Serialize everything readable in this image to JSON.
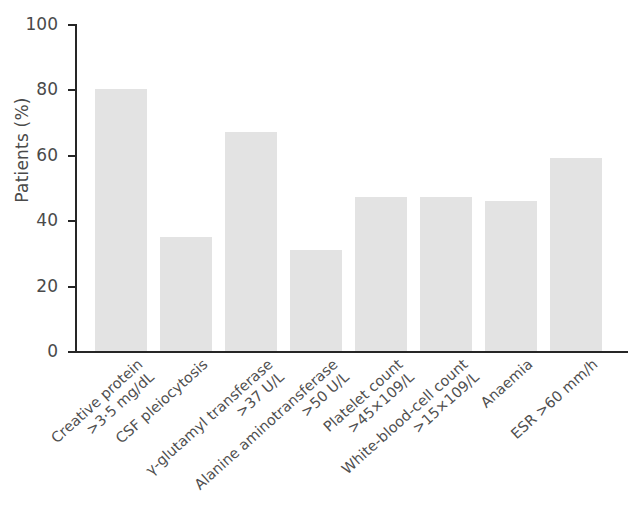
{
  "chart_data": {
    "type": "bar",
    "title": "",
    "subtitle": "",
    "xlabel": "",
    "ylabel": "Patients (%)",
    "ylim": [
      0,
      100
    ],
    "yticks": [
      0,
      20,
      40,
      60,
      80,
      100
    ],
    "ytick_labels": [
      "0",
      "20",
      "40",
      "60",
      "80",
      "100"
    ],
    "grid": false,
    "legend": false,
    "bar_color": "#e3e3e3",
    "axis_color": "#262626",
    "text_color": "#4a4a4a",
    "categories": [
      "Creative protein >3·5 mg/dL",
      "CSF pleiocytosis",
      "γ-glutamyl transferase >37 U/L",
      "Alanine aminotransferase >50 U/L",
      "Platelet count >45×10⁹/L",
      "White-blood-cell count >15×10⁹/L",
      "Anaemia",
      "ESR >60 mm/h"
    ],
    "category_lines": [
      {
        "line1": "Creative protein",
        "line2": ">3·5 mg/dL"
      },
      {
        "line1": "CSF pleiocytosis",
        "line2": ""
      },
      {
        "line1": "γ-glutamyl transferase",
        "line2": ">37 U/L"
      },
      {
        "line1": "Alanine aminotransferase",
        "line2": ">50 U/L"
      },
      {
        "line1": "Platelet count",
        "line2": ">45×109/L"
      },
      {
        "line1": "White-blood-cell count",
        "line2": ">15×109/L"
      },
      {
        "line1": "Anaemia",
        "line2": ""
      },
      {
        "line1": "ESR >60 mm/h",
        "line2": ""
      }
    ],
    "values": [
      80,
      35,
      67,
      31,
      47,
      47,
      46,
      59
    ]
  }
}
